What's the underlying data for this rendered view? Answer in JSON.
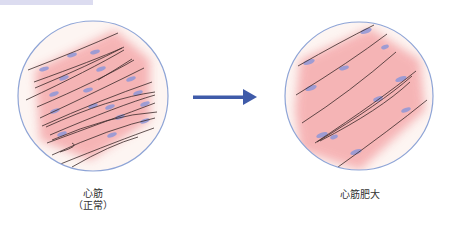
{
  "diagram": {
    "colors": {
      "circle_border": "#8ea4d6",
      "tissue_pink": "#f4a8a8",
      "tissue_bg": "#fbeeee",
      "nucleus": "#8f97d8",
      "fiber_line": "#3a2a2a",
      "arrow": "#3f5ba9",
      "topbar": "#dcdcf0"
    },
    "left_panel": {
      "label_line1": "心筋",
      "label_line2": "（正常）"
    },
    "arrow": {
      "direction": "right"
    },
    "right_panel": {
      "label": "心筋肥大"
    }
  }
}
